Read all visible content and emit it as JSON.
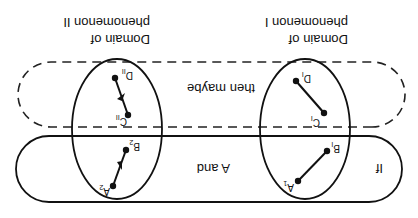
{
  "figure": {
    "orientation": "rotated-180",
    "colors": {
      "ink": "#111111",
      "background": "#ffffff"
    },
    "top_labels": {
      "domain_I_line1": "Domain of",
      "domain_I_line2": "phenomenon I",
      "domain_II_line1": "Domain of",
      "domain_II_line2": "phenomenon II"
    },
    "solid_region": {
      "label_if": "If",
      "label_and": "A and"
    },
    "dashed_region": {
      "label": "then maybe"
    },
    "points": {
      "A1": {
        "base": "A",
        "sub": "1"
      },
      "B1": {
        "base": "B",
        "sub": "I"
      },
      "C1": {
        "base": "C",
        "sub": "I"
      },
      "D1": {
        "base": "D",
        "sub": "I"
      },
      "A2": {
        "base": "A",
        "sub": "2"
      },
      "B2": {
        "base": "B",
        "sub": "2"
      },
      "C2": {
        "base": "C",
        "sub": "II"
      },
      "D2": {
        "base": "D",
        "sub": "II"
      }
    }
  }
}
